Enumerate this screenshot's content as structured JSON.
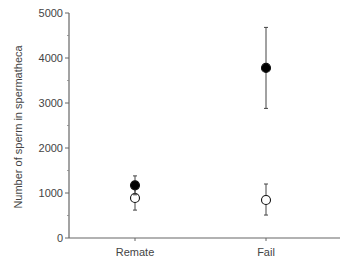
{
  "chart_data": {
    "type": "scatter",
    "title": "",
    "xlabel": "",
    "ylabel": "Number of sperm in spermatheca",
    "categories": [
      "Remate",
      "Fail"
    ],
    "ylim": [
      0,
      5000
    ],
    "yticks": [
      0,
      1000,
      2000,
      3000,
      4000,
      5000
    ],
    "ytick_labels": [
      "0",
      "1000",
      "2000",
      "3000",
      "4000",
      "5000"
    ],
    "minor_ticks": [
      500,
      1500,
      2500,
      3500,
      4500
    ],
    "grid": false,
    "legend": null,
    "series": [
      {
        "name": "filled",
        "marker": "filled-circle",
        "color": "#000000",
        "values": [
          1170,
          3780
        ],
        "err_low": [
          960,
          2880
        ],
        "err_high": [
          1380,
          4680
        ]
      },
      {
        "name": "open",
        "marker": "open-circle",
        "color": "#ffffff",
        "values": [
          890,
          845
        ],
        "err_low": [
          620,
          510
        ],
        "err_high": [
          1150,
          1200
        ]
      }
    ]
  }
}
